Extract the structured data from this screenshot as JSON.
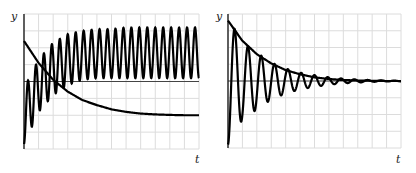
{
  "chart_data": [
    {
      "type": "line",
      "title": "",
      "xlabel": "t",
      "ylabel": "y",
      "grid": true,
      "legend": null,
      "x_gridlines": 12,
      "y_gridlines": 8,
      "xlim": [
        0,
        12
      ],
      "ylim": [
        -4,
        4
      ],
      "series": [
        {
          "name": "decaying exponential",
          "description": "starts at y≈2.4, decays to steady value ≈ -2.0",
          "x": [
            0,
            1,
            2,
            3,
            4,
            5,
            6,
            7,
            8,
            9,
            10,
            11,
            12
          ],
          "values": [
            2.4,
            1.1,
            0.1,
            -0.6,
            -1.1,
            -1.4,
            -1.65,
            -1.8,
            -1.9,
            -1.95,
            -1.98,
            -2.0,
            -2.0
          ]
        },
        {
          "name": "forced oscillation",
          "description": "starts at y≈-3.7, grows into steady oscillation between ≈0.2 and ≈3.2 (about 22 cycles)",
          "x": [
            0,
            1,
            2,
            3,
            4,
            5,
            6,
            7,
            8,
            9,
            10,
            11,
            12
          ],
          "values_min": [
            -3.7,
            -1.8,
            -0.8,
            -0.2,
            0.1,
            0.2,
            0.2,
            0.2,
            0.2,
            0.2,
            0.2,
            0.2,
            0.2
          ],
          "values_max": [
            -0.4,
            1.3,
            2.3,
            2.8,
            3.0,
            3.1,
            3.1,
            3.2,
            3.2,
            3.2,
            3.2,
            3.2,
            3.2
          ]
        }
      ]
    },
    {
      "type": "line",
      "title": "",
      "xlabel": "t",
      "ylabel": "y",
      "grid": true,
      "legend": null,
      "x_gridlines": 12,
      "y_gridlines": 8,
      "xlim": [
        0,
        12
      ],
      "ylim": [
        -4,
        4
      ],
      "series": [
        {
          "name": "decaying exponential",
          "description": "starts at y≈3.6, decays to 0",
          "x": [
            0,
            1,
            2,
            3,
            4,
            5,
            6,
            7,
            8,
            9,
            10,
            11,
            12
          ],
          "values": [
            3.6,
            2.4,
            1.6,
            1.05,
            0.65,
            0.4,
            0.22,
            0.12,
            0.06,
            0.03,
            0.01,
            0.0,
            0.0
          ]
        },
        {
          "name": "damped oscillation",
          "description": "starts at y≈-3.8, oscillates about 0 with decaying amplitude (about 13 cycles)",
          "x": [
            0,
            1,
            2,
            3,
            4,
            5,
            6,
            7,
            8,
            9,
            10,
            11,
            12
          ],
          "amplitude": [
            3.8,
            2.3,
            1.7,
            1.1,
            0.75,
            0.5,
            0.35,
            0.22,
            0.14,
            0.09,
            0.05,
            0.03,
            0.02
          ]
        }
      ]
    }
  ],
  "panels": [
    {
      "ylabel": "y",
      "xlabel": "t"
    },
    {
      "ylabel": "y",
      "xlabel": "t"
    }
  ]
}
